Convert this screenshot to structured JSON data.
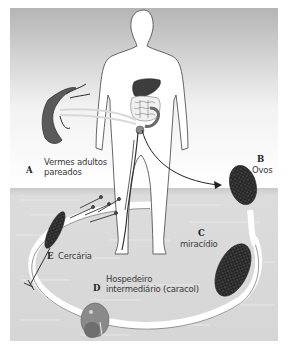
{
  "diagram": {
    "stages": [
      {
        "letter": "A",
        "line1": "Vermes adultos",
        "line2": "pareados"
      },
      {
        "letter": "B",
        "line1": "Ovos"
      },
      {
        "letter": "C",
        "line1": "miracídio"
      },
      {
        "letter": "D",
        "line1": "Hospedeiro",
        "line2": "intermediário (caracol)"
      },
      {
        "letter": "E",
        "line1": "Cercária"
      }
    ],
    "colors": {
      "sky_top": "#b8b8b8",
      "sky_bottom": "#ffffff",
      "water": "#d4d4d4",
      "stage_dark": "#2b2b2b",
      "liver": "#3d3d3d",
      "worm": "#5a5a5a",
      "snail": "#8a8a8a",
      "path": "#ffffff"
    }
  }
}
